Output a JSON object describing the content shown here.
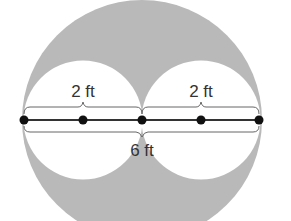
{
  "diagram": {
    "type": "geometry-shaded-region",
    "labels": {
      "left_radius": "2 ft",
      "right_radius": "2 ft",
      "diameter": "6 ft"
    },
    "colors": {
      "shaded": "#b8b8b8",
      "small_circles": "#ffffff",
      "line": "#333333",
      "points": "#111111",
      "brace": "#555555"
    },
    "points_count": 5
  }
}
